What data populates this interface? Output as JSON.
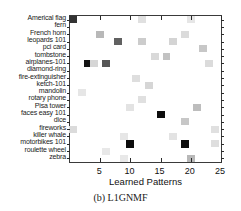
{
  "caption": "(b) L1GNMF",
  "chart_data": {
    "type": "heatmap",
    "title": "",
    "subtitle": "",
    "xlabel": "Learned Patterns",
    "ylabel": "",
    "xlim": [
      0,
      25
    ],
    "xticks": [
      5,
      10,
      15,
      20,
      25
    ],
    "grid": false,
    "legend": "none",
    "colormap": "grayscale-inverted",
    "categories": [
      "Americal flag",
      "fern",
      "French horn",
      "leopards 101",
      "pci card",
      "tombstone",
      "airplanes-101",
      "diamond-ring",
      "fire-extinguisher",
      "ketch-101",
      "mandolin",
      "rotary phone",
      "Pisa tower",
      "faces easy 101",
      "dice",
      "fireworks",
      "killer whale",
      "motorbikes 101",
      "roulette wheel",
      "zebra"
    ],
    "cells": [
      {
        "x": 0.5,
        "row": 0,
        "value": 0.8
      },
      {
        "x": 12.0,
        "row": 0,
        "value": 0.12
      },
      {
        "x": 20.0,
        "row": 0,
        "value": 0.1
      },
      {
        "x": 5.0,
        "row": 2,
        "value": 0.28
      },
      {
        "x": 19.0,
        "row": 2,
        "value": 0.14
      },
      {
        "x": 8.0,
        "row": 3,
        "value": 0.62
      },
      {
        "x": 12.0,
        "row": 3,
        "value": 0.2
      },
      {
        "x": 17.0,
        "row": 3,
        "value": 0.17
      },
      {
        "x": 22.0,
        "row": 4,
        "value": 0.22
      },
      {
        "x": 14.0,
        "row": 5,
        "value": 0.15
      },
      {
        "x": 16.0,
        "row": 5,
        "value": 0.24
      },
      {
        "x": 3.0,
        "row": 6,
        "value": 0.92
      },
      {
        "x": 4.0,
        "row": 6,
        "value": 0.16
      },
      {
        "x": 6.0,
        "row": 6,
        "value": 0.66
      },
      {
        "x": 23.0,
        "row": 6,
        "value": 0.14
      },
      {
        "x": 11.0,
        "row": 8,
        "value": 0.13
      },
      {
        "x": 13.0,
        "row": 9,
        "value": 0.16
      },
      {
        "x": 2.0,
        "row": 10,
        "value": 0.1
      },
      {
        "x": 12.0,
        "row": 11,
        "value": 0.12
      },
      {
        "x": 10.0,
        "row": 12,
        "value": 0.11
      },
      {
        "x": 21.0,
        "row": 12,
        "value": 0.26
      },
      {
        "x": 15.0,
        "row": 13,
        "value": 0.95
      },
      {
        "x": 19.0,
        "row": 14,
        "value": 0.22
      },
      {
        "x": 0.5,
        "row": 15,
        "value": 0.14
      },
      {
        "x": 24.0,
        "row": 15,
        "value": 0.12
      },
      {
        "x": 9.0,
        "row": 16,
        "value": 0.1
      },
      {
        "x": 17.0,
        "row": 16,
        "value": 0.11
      },
      {
        "x": 10.0,
        "row": 17,
        "value": 0.95
      },
      {
        "x": 19.0,
        "row": 17,
        "value": 0.95
      },
      {
        "x": 24.0,
        "row": 17,
        "value": 0.13
      },
      {
        "x": 6.0,
        "row": 18,
        "value": 0.09
      },
      {
        "x": 20.0,
        "row": 19,
        "value": 0.28
      },
      {
        "x": 9.0,
        "row": 19,
        "value": 0.09
      }
    ]
  }
}
